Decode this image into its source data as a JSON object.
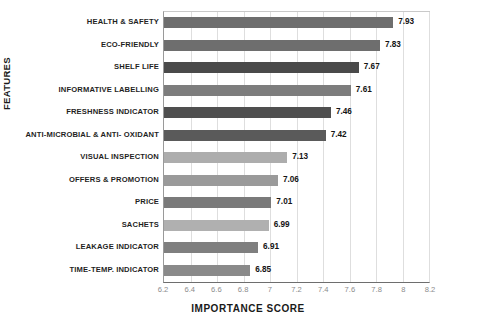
{
  "chart_data": {
    "type": "bar",
    "orientation": "horizontal",
    "title": "",
    "xlabel": "IMPORTANCE SCORE",
    "ylabel": "FEATURES",
    "xlim": [
      6.2,
      8.2
    ],
    "xticks": [
      "6.2",
      "6.4",
      "6.6",
      "6.8",
      "7",
      "7.2",
      "7.4",
      "7.6",
      "7.8",
      "8",
      "8.2"
    ],
    "grid": true,
    "legend": false,
    "categories": [
      "HEALTH & SAFETY",
      "ECO-FRIENDLY",
      "SHELF LIFE",
      "INFORMATIVE LABELLING",
      "FRESHNESS INDICATOR",
      "ANTI-MICROBIAL & ANTI- OXIDANT",
      "VISUAL INSPECTION",
      "OFFERS & PROMOTION",
      "PRICE",
      "SACHETS",
      "LEAKAGE INDICATOR",
      "TIME-TEMP. INDICATOR"
    ],
    "values": [
      7.93,
      7.83,
      7.67,
      7.61,
      7.46,
      7.42,
      7.13,
      7.06,
      7.01,
      6.99,
      6.91,
      6.85
    ],
    "value_labels": [
      "7.93",
      "7.83",
      "7.67",
      "7.61",
      "7.46",
      "7.42",
      "7.13",
      "7.06",
      "7.01",
      "6.99",
      "6.91",
      "6.85"
    ],
    "bar_colors": [
      "#6e6e6e",
      "#6e6e6e",
      "#4a4a4a",
      "#7d7d7d",
      "#4f4f4f",
      "#5a5a5a",
      "#adadad",
      "#9a9a9a",
      "#7a7a7a",
      "#b0b0b0",
      "#7f7f7f",
      "#8a8a8a"
    ],
    "grid_color": "#dedede",
    "axis_color": "#6e6e6e"
  }
}
